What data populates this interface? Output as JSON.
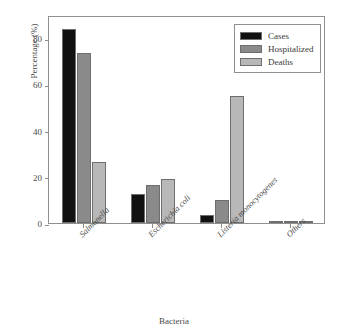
{
  "chart_data": {
    "type": "bar",
    "title": "",
    "xlabel": "Bacteria",
    "ylabel": "Percentage (%)",
    "categories": [
      "Salmonella",
      "Escherichia coli",
      "Listeria monocytogenes",
      "Others"
    ],
    "series": [
      {
        "name": "Cases",
        "color": "#111111",
        "values": [
          84.0,
          12.5,
          3.5,
          0.8
        ]
      },
      {
        "name": "Hospitalized",
        "color": "#8a8a8a",
        "values": [
          73.5,
          16.5,
          10.0,
          0.8
        ]
      },
      {
        "name": "Deaths",
        "color": "#b8b8b8",
        "values": [
          26.2,
          19.2,
          55.0,
          0.5
        ]
      }
    ],
    "ylim": [
      0,
      90
    ],
    "yticks": [
      0,
      20,
      40,
      60,
      80
    ],
    "ytick_labels": [
      "0",
      "20",
      "40",
      "60",
      "80"
    ],
    "grid": false,
    "legend_position": "top-right",
    "axis_color": "#8f8f8f",
    "bar_edge_color": "#6e6e6e",
    "background": "#ffffff"
  },
  "legend": {
    "items": [
      {
        "label": "Cases"
      },
      {
        "label": "Hospitalized"
      },
      {
        "label": "Deaths"
      }
    ]
  }
}
